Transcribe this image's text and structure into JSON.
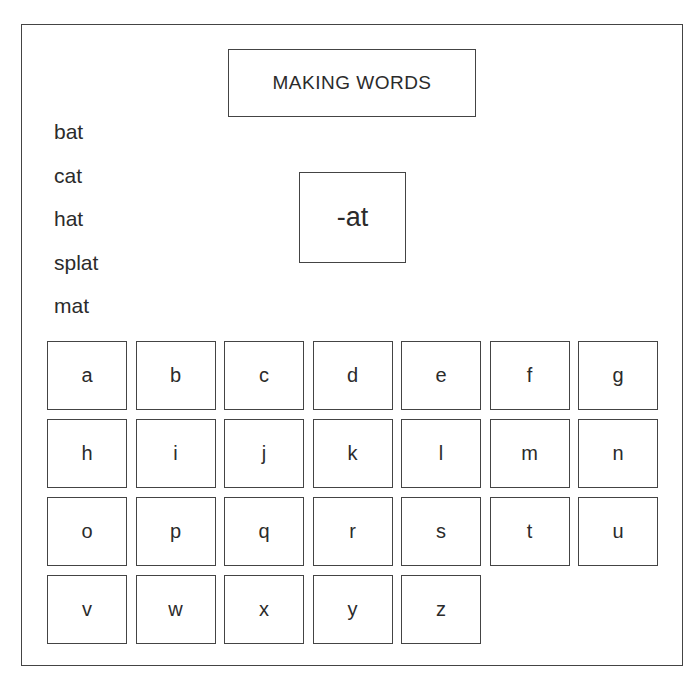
{
  "title": "MAKING WORDS",
  "word_family": "-at",
  "words": [
    "bat",
    "cat",
    "hat",
    "splat",
    "mat"
  ],
  "letter_tiles": [
    [
      "a",
      "b",
      "c",
      "d",
      "e",
      "f",
      "g"
    ],
    [
      "h",
      "i",
      "j",
      "k",
      "l",
      "m",
      "n"
    ],
    [
      "o",
      "p",
      "q",
      "r",
      "s",
      "t",
      "u"
    ],
    [
      "v",
      "w",
      "x",
      "y",
      "z"
    ]
  ],
  "colors": {
    "border": "#444444",
    "text": "#2b2b2b",
    "background": "#ffffff"
  }
}
